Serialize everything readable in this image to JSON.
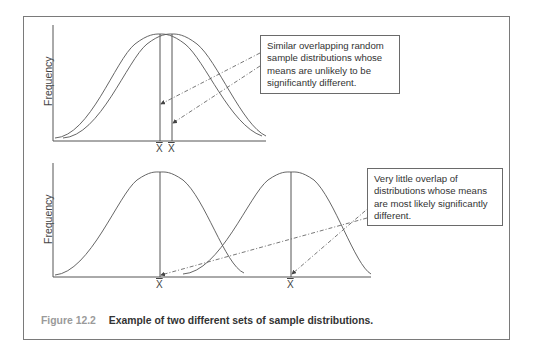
{
  "figure": {
    "number": "Figure 12.2",
    "caption": "Example of two different sets of sample distributions.",
    "colors": {
      "line": "#555555",
      "text": "#333333",
      "caption_number": "#9a9a9a",
      "frame": "#7a7a7a"
    }
  },
  "top_panel": {
    "ylabel": "Frequency",
    "mean_labels": [
      "X̄",
      "X̄"
    ],
    "callout": {
      "lines": [
        "Similar overlapping random",
        "sample distributions whose",
        "means are unlikely to be",
        "significantly different."
      ]
    }
  },
  "bottom_panel": {
    "ylabel": "Frequency",
    "mean_labels": [
      "X̄",
      "X̄"
    ],
    "callout": {
      "lines": [
        "Very little overlap of",
        "distributions whose means",
        "are most likely significantly",
        "different."
      ]
    }
  }
}
